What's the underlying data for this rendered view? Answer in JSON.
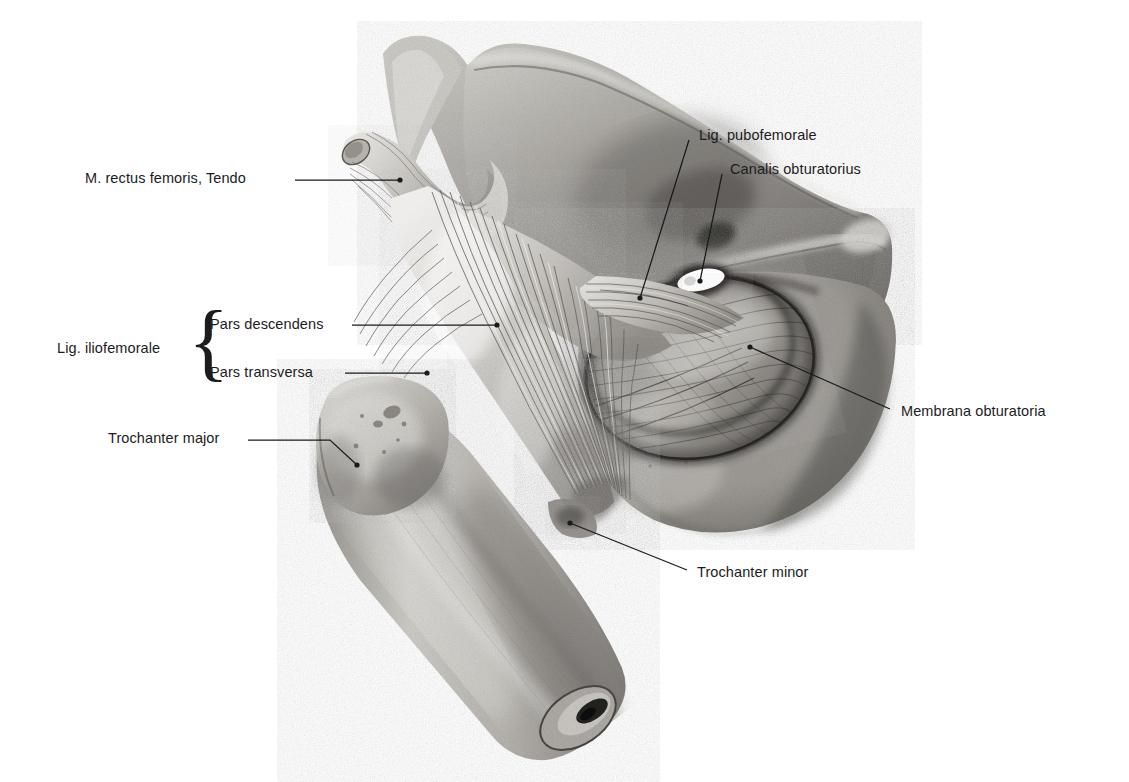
{
  "figure": {
    "background_color": "#ffffff",
    "text_color": "#1c1c1c",
    "leader_color": "#1a1a1a",
    "style": "grayscale pencil / stipple anatomical illustration"
  },
  "labels": [
    {
      "id": "rectus-femoris-tendo",
      "text": "M. rectus femoris, Tendo",
      "x": 85,
      "y": 170,
      "align": "left",
      "leader": {
        "from": [
          295,
          180
        ],
        "to": [
          400,
          180
        ],
        "dot": [
          400,
          180
        ]
      }
    },
    {
      "id": "lig-iliofemorale",
      "text": "Lig. iliofemorale",
      "x": 57,
      "y": 340,
      "align": "left",
      "leader": null
    },
    {
      "id": "pars-descendens",
      "text": "Pars descendens",
      "x": 210,
      "y": 316,
      "align": "left",
      "leader": {
        "from": [
          352,
          325
        ],
        "to": [
          497,
          325
        ],
        "dot": [
          497,
          325
        ]
      }
    },
    {
      "id": "pars-transversa",
      "text": "Pars transversa",
      "x": 210,
      "y": 364,
      "align": "left",
      "leader": {
        "from": [
          345,
          373
        ],
        "to": [
          427,
          373
        ],
        "dot": [
          427,
          373
        ]
      }
    },
    {
      "id": "trochanter-major",
      "text": "Trochanter major",
      "x": 108,
      "y": 430,
      "align": "left",
      "leader": {
        "from": [
          248,
          440
        ],
        "to": [
          330,
          440
        ],
        "dot": [
          357,
          465
        ],
        "elbow": [
          330,
          440
        ]
      }
    },
    {
      "id": "lig-pubofemorale",
      "text": "Lig. pubofemorale",
      "x": 699,
      "y": 127,
      "align": "left",
      "leader": {
        "from": [
          689,
          140
        ],
        "to": [
          640,
          298
        ],
        "dot": [
          640,
          298
        ]
      }
    },
    {
      "id": "canalis-obturatorius",
      "text": "Canalis obturatorius",
      "x": 730,
      "y": 161,
      "align": "left",
      "leader": {
        "from": [
          722,
          174
        ],
        "to": [
          700,
          281
        ],
        "dot": [
          700,
          281
        ]
      }
    },
    {
      "id": "membrana-obturatoria",
      "text": "Membrana obturatoria",
      "x": 901,
      "y": 403,
      "align": "left",
      "leader": {
        "from": [
          890,
          409
        ],
        "to": [
          750,
          347
        ],
        "dot": [
          750,
          347
        ]
      }
    },
    {
      "id": "trochanter-minor",
      "text": "Trochanter minor",
      "x": 697,
      "y": 564,
      "align": "left",
      "leader": {
        "from": [
          687,
          570
        ],
        "to": [
          570,
          523
        ],
        "dot": [
          570,
          523
        ]
      }
    }
  ],
  "brace": {
    "glyph": "{",
    "x": 188,
    "y": 306,
    "height": 86,
    "groups": [
      "Pars descendens",
      "Pars transversa"
    ],
    "label_for": "Lig. iliofemorale"
  },
  "structures": [
    {
      "name": "os-ilium",
      "label": "Ilium wing"
    },
    {
      "name": "spina-iliaca-anterior-superior",
      "label": "Anterior superior iliac spine"
    },
    {
      "name": "spina-iliaca-anterior-inferior",
      "label": "Anterior inferior iliac spine"
    },
    {
      "name": "rectus-femoris-tendon",
      "label": "Rectus femoris tendon (cut)"
    },
    {
      "name": "lig-iliofemorale-descendens",
      "label": "Iliofemoral ligament, descending part"
    },
    {
      "name": "lig-iliofemorale-transversa",
      "label": "Iliofemoral ligament, transverse part"
    },
    {
      "name": "lig-pubofemorale",
      "label": "Pubofemoral ligament"
    },
    {
      "name": "ramus-superior-ossis-pubis",
      "label": "Superior pubic ramus"
    },
    {
      "name": "canalis-obturatorius",
      "label": "Obturator canal"
    },
    {
      "name": "membrana-obturatoria",
      "label": "Obturator membrane"
    },
    {
      "name": "tuber-ischiadicum",
      "label": "Ischial tuberosity"
    },
    {
      "name": "trochanter-major",
      "label": "Greater trochanter"
    },
    {
      "name": "trochanter-minor",
      "label": "Lesser trochanter"
    },
    {
      "name": "corpus-femoris",
      "label": "Femoral shaft, cut"
    },
    {
      "name": "cavitas-medullaris",
      "label": "Medullary cavity"
    }
  ]
}
